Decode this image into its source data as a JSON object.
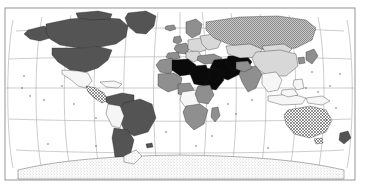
{
  "figure": {
    "type": "world-choropleth-map",
    "projection": "Robinson",
    "background_color": "#ffffff",
    "frame": {
      "x": 5,
      "y": 8,
      "width": 350,
      "height": 172,
      "stroke_color": "#7a7a7a",
      "stroke_width": 0.8
    }
  },
  "graticule": {
    "stroke_color": "#9a9a9a",
    "stroke_width": 0.5,
    "meridian_interval_deg": 30,
    "parallel_interval_deg": 30,
    "meridians_deg": [
      -180,
      -150,
      -120,
      -90,
      -60,
      -30,
      0,
      30,
      60,
      90,
      120,
      150,
      180
    ],
    "parallels_deg": [
      60,
      30,
      0,
      -30,
      -60
    ]
  },
  "legend_categories": [
    {
      "key": "dark",
      "fill": "#545454",
      "name": "dark-gray-fill"
    },
    {
      "key": "medium",
      "fill": "#8f8f8f",
      "name": "medium-gray-fill"
    },
    {
      "key": "light",
      "fill": "#d8d8d8",
      "name": "light-gray-fill"
    },
    {
      "key": "white",
      "fill": "#f6f6f6",
      "name": "white-fill"
    },
    {
      "key": "black",
      "fill": "#0a0a0a",
      "name": "black-fill"
    },
    {
      "key": "hatch",
      "fill": "url(#hatchPattern)",
      "name": "diagonal-hatch-fill"
    },
    {
      "key": "stipple-dark",
      "fill": "url(#stippleDark)",
      "name": "dark-stipple-fill"
    },
    {
      "key": "stipple-light",
      "fill": "url(#stippleLight)",
      "name": "light-stipple-fill"
    }
  ],
  "chart_data": {
    "type": "map",
    "title": "",
    "regions": [
      {
        "name": "Greenland",
        "category": "dark"
      },
      {
        "name": "Canada",
        "category": "dark"
      },
      {
        "name": "Alaska",
        "category": "dark"
      },
      {
        "name": "United States",
        "category": "dark"
      },
      {
        "name": "Mexico",
        "category": "white"
      },
      {
        "name": "Central America",
        "category": "hatch"
      },
      {
        "name": "Caribbean",
        "category": "white"
      },
      {
        "name": "Colombia",
        "category": "dark"
      },
      {
        "name": "Venezuela",
        "category": "dark"
      },
      {
        "name": "Brazil",
        "category": "dark"
      },
      {
        "name": "Peru",
        "category": "white"
      },
      {
        "name": "Bolivia",
        "category": "white"
      },
      {
        "name": "Chile",
        "category": "dark"
      },
      {
        "name": "Argentina",
        "category": "dark"
      },
      {
        "name": "Iceland",
        "category": "medium"
      },
      {
        "name": "Scandinavia",
        "category": "medium"
      },
      {
        "name": "United Kingdom",
        "category": "medium"
      },
      {
        "name": "Western Europe",
        "category": "medium"
      },
      {
        "name": "Central Europe",
        "category": "light"
      },
      {
        "name": "Eastern Europe",
        "category": "light"
      },
      {
        "name": "Russia",
        "category": "stipple-dark"
      },
      {
        "name": "Turkey",
        "category": "medium"
      },
      {
        "name": "Middle East",
        "category": "black"
      },
      {
        "name": "Saudi Arabia",
        "category": "black"
      },
      {
        "name": "Iran",
        "category": "black"
      },
      {
        "name": "Algeria",
        "category": "black"
      },
      {
        "name": "Libya",
        "category": "black"
      },
      {
        "name": "Sudan",
        "category": "black"
      },
      {
        "name": "Morocco",
        "category": "medium"
      },
      {
        "name": "West Africa",
        "category": "medium"
      },
      {
        "name": "Nigeria",
        "category": "medium"
      },
      {
        "name": "Central Africa",
        "category": "white"
      },
      {
        "name": "East Africa",
        "category": "medium"
      },
      {
        "name": "Southern Africa",
        "category": "medium"
      },
      {
        "name": "Madagascar",
        "category": "medium"
      },
      {
        "name": "Kazakhstan",
        "category": "light"
      },
      {
        "name": "China",
        "category": "light"
      },
      {
        "name": "Mongolia",
        "category": "light"
      },
      {
        "name": "India",
        "category": "medium"
      },
      {
        "name": "Pakistan",
        "category": "medium"
      },
      {
        "name": "Southeast Asia",
        "category": "white"
      },
      {
        "name": "Indonesia",
        "category": "white"
      },
      {
        "name": "Japan",
        "category": "medium"
      },
      {
        "name": "Philippines",
        "category": "white"
      },
      {
        "name": "Papua New Guinea",
        "category": "white"
      },
      {
        "name": "Australia",
        "category": "hatch"
      },
      {
        "name": "New Zealand",
        "category": "dark"
      },
      {
        "name": "Antarctica",
        "category": "stipple-light"
      }
    ]
  }
}
